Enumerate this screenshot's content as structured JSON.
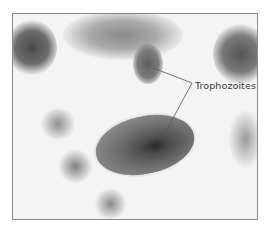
{
  "figure": {
    "label": "Trophozoites",
    "colors": {
      "background": "#f4f4f4",
      "border": "#8a8a8a",
      "stain_dark": "#3a3a3a",
      "stain_mid": "#7a7a7a",
      "leader_line": "#555555"
    }
  }
}
